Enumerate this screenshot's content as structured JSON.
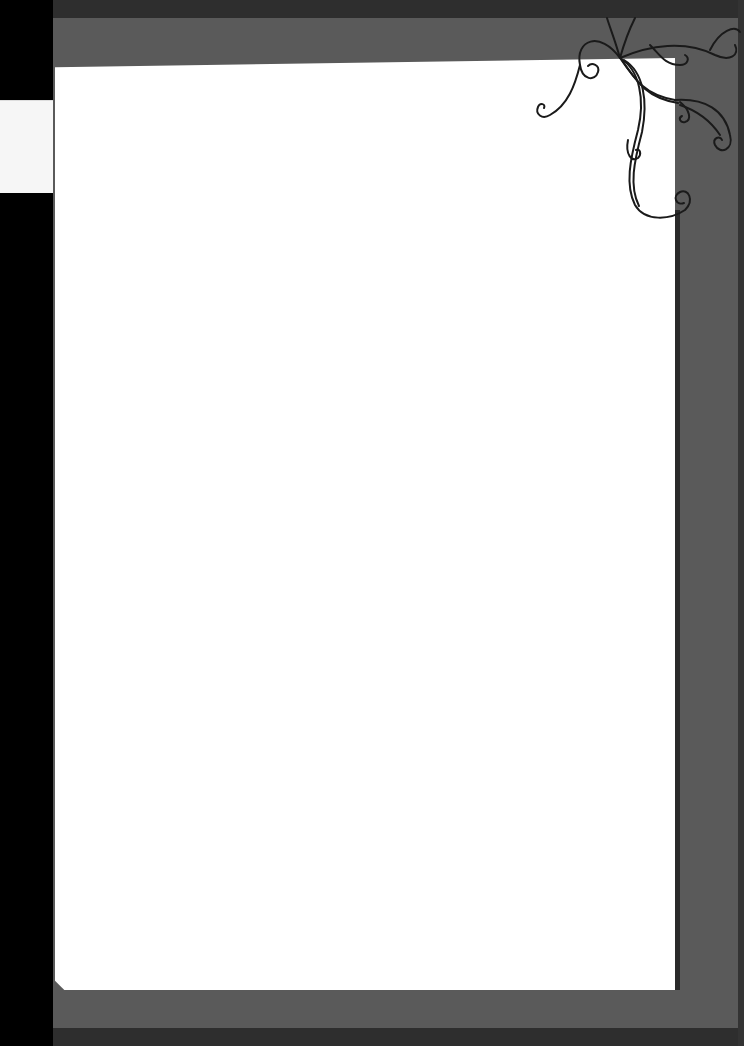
{
  "page": {
    "type": "decorative blank stationery frame",
    "content_text": "",
    "colors": {
      "frame": "#5a5a5a",
      "frame_edge": "#2e2e2e",
      "paper": "#ffffff",
      "background": "#000000",
      "ornament_stroke": "#1a1a1a"
    },
    "ornament": "corner-swirl-icon"
  }
}
